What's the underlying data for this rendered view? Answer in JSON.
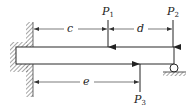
{
  "diagram": {
    "type": "beam-loading",
    "colors": {
      "line": "#2a2a2a",
      "hatch": "#6a6a6a",
      "beam_fill": "#ffffff",
      "dimension": "#444444"
    },
    "support_left": "fixed-wall",
    "support_right": "roller",
    "loads": [
      {
        "label_main": "P",
        "label_sub": "1",
        "direction": "down"
      },
      {
        "label_main": "P",
        "label_sub": "2",
        "direction": "down"
      },
      {
        "label_main": "P",
        "label_sub": "3",
        "direction": "up"
      }
    ],
    "dimensions": [
      {
        "label": "c"
      },
      {
        "label": "d"
      },
      {
        "label": "e"
      }
    ]
  }
}
